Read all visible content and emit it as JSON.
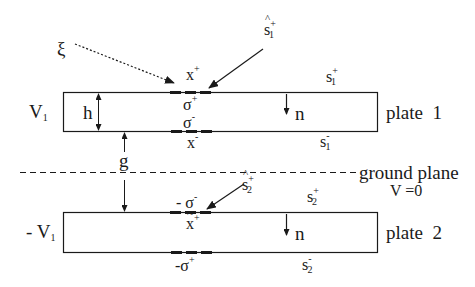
{
  "diagram": {
    "colors": {
      "stroke": "#1a1a1a",
      "background": "#ffffff"
    },
    "plates": [
      {
        "name": "plate 1",
        "label": "plate  1",
        "voltage": {
          "base": "V",
          "sub": "1",
          "prefix": ""
        },
        "top_surface": {
          "base": "s",
          "sub": "1",
          "sup": "+"
        },
        "bottom_surface": {
          "base": "s",
          "sub": "1",
          "sup": "-"
        },
        "normal_label": "n",
        "thickness_label": "h",
        "charges": {
          "top_point": {
            "base": "x",
            "sup": "+"
          },
          "top_density": {
            "base": "σ",
            "sup": "+"
          },
          "bottom_density": {
            "base": "σ",
            "sup": "-"
          },
          "bottom_point": {
            "base": "x",
            "sup": "-"
          }
        },
        "incoming_ray": {
          "base": "s",
          "sub": "1",
          "sup": "+",
          "accent": "^"
        }
      },
      {
        "name": "plate 2",
        "label": "plate  2",
        "voltage": {
          "base": "V",
          "sub": "1",
          "prefix": "- "
        },
        "top_surface": {
          "base": "s",
          "sub": "2",
          "sup": "+"
        },
        "bottom_surface": {
          "base": "s",
          "sub": "2",
          "sup": "-"
        },
        "normal_label": "n",
        "charges": {
          "top_density": {
            "prefix": "- ",
            "base": "σ",
            "sup": "-"
          },
          "top_point": {
            "base": "x",
            "sup": "+",
            "accent": "~"
          },
          "bottom_density": {
            "prefix": "-",
            "base": "σ",
            "sup": "+"
          }
        },
        "incoming_ray": {
          "base": "s",
          "sub": "2",
          "sup": "+",
          "accent": "^"
        }
      }
    ],
    "ground_plane": {
      "label": "ground plane",
      "potential": "V =0"
    },
    "gap_label": "g",
    "source_label": "ξ"
  }
}
